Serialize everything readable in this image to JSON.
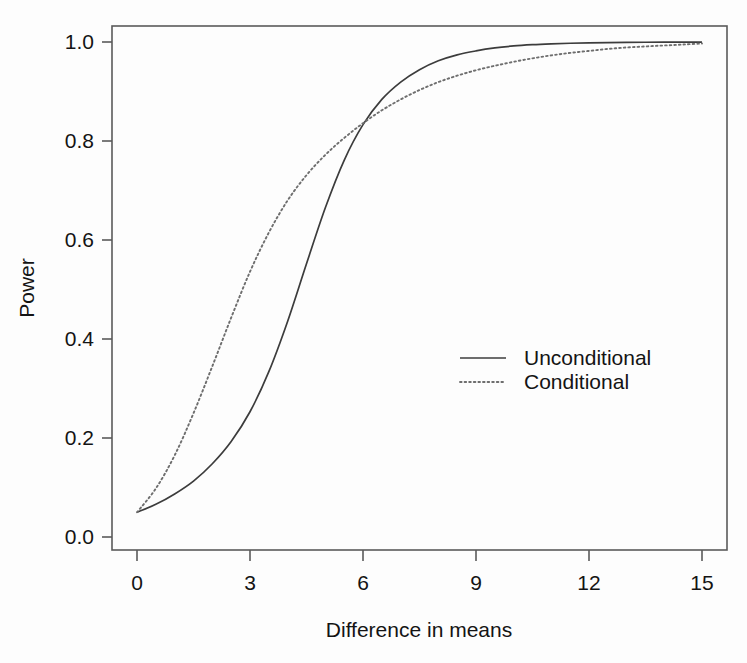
{
  "chart_data": {
    "type": "line",
    "title": "",
    "xlabel": "Difference in means",
    "ylabel": "Power",
    "xlim": [
      0,
      15
    ],
    "ylim": [
      0,
      1.0
    ],
    "xticks": [
      0,
      3,
      6,
      9,
      12,
      15
    ],
    "xtick_labels": [
      "0",
      "3",
      "6",
      "9",
      "12",
      "15"
    ],
    "yticks": [
      0.0,
      0.2,
      0.4,
      0.6,
      0.8,
      1.0
    ],
    "ytick_labels": [
      "0.0",
      "0.2",
      "0.4",
      "0.6",
      "0.8",
      "1.0"
    ],
    "grid": false,
    "legend_position": "center-right",
    "x": [
      0,
      0.5,
      1,
      1.5,
      2,
      2.5,
      3,
      3.5,
      4,
      4.5,
      5,
      5.5,
      6,
      6.5,
      7,
      7.5,
      8,
      8.5,
      9,
      9.5,
      10,
      10.5,
      11,
      11.5,
      12,
      12.5,
      13,
      13.5,
      14,
      14.5,
      15
    ],
    "series": [
      {
        "name": "Unconditional",
        "style": "solid",
        "color": "#3c3c3c",
        "values": [
          0.05,
          0.066,
          0.087,
          0.113,
          0.148,
          0.193,
          0.253,
          0.334,
          0.436,
          0.552,
          0.665,
          0.761,
          0.833,
          0.884,
          0.919,
          0.944,
          0.962,
          0.974,
          0.982,
          0.988,
          0.992,
          0.9945,
          0.9962,
          0.9975,
          0.9983,
          0.9989,
          0.9993,
          0.9995,
          0.9997,
          0.9998,
          0.9999
        ]
      },
      {
        "name": "Conditional",
        "style": "dotted",
        "color": "#6e6e6e",
        "values": [
          0.05,
          0.098,
          0.165,
          0.25,
          0.345,
          0.443,
          0.536,
          0.615,
          0.68,
          0.731,
          0.772,
          0.806,
          0.836,
          0.862,
          0.884,
          0.903,
          0.919,
          0.932,
          0.943,
          0.952,
          0.96,
          0.967,
          0.973,
          0.978,
          0.982,
          0.986,
          0.989,
          0.991,
          0.993,
          0.995,
          0.997
        ]
      }
    ],
    "annotations": {
      "crossing_point": {
        "x": 5.0,
        "y": 0.745
      },
      "baseline_alpha": 0.05
    }
  },
  "legend": {
    "entries": [
      {
        "label": "Unconditional",
        "style": "solid"
      },
      {
        "label": "Conditional",
        "style": "dotted"
      }
    ]
  }
}
